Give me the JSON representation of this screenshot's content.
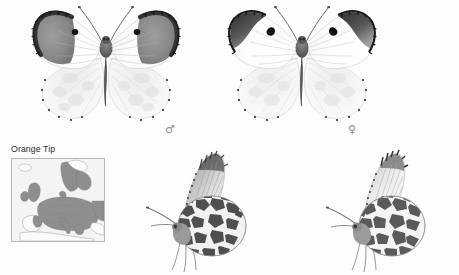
{
  "plate": {
    "kind": "field-guide-species-plate",
    "species_label": "Orange Tip",
    "background_color": "#fdfdfd",
    "width": 459,
    "height": 275
  },
  "map": {
    "title": "Orange Tip",
    "region": "Europe",
    "border_color": "#b6b6b6",
    "sea_color": "#f4f4f4",
    "land_unoccupied_color": "#fbfbfb",
    "range_fill_color": "#8e8e8e",
    "coast_line_color": "#9a9a9a"
  },
  "symbols": {
    "male": "♂",
    "female": "♀",
    "symbol_color": "#8d8d8d"
  },
  "specimens": [
    {
      "id": "male-upperside",
      "name": "male-upperside-specimen",
      "sex": "male",
      "view": "upperside",
      "sex_symbol": "♂",
      "wing_ground_color": "#fbfbfb",
      "apex_patch_color": "#8a8a8a",
      "apex_border_color": "#3a3a3a",
      "discal_spot_color": "#171717",
      "body_color": "#6e6e6e",
      "hindwing_mottle_color": "#dcdcdc",
      "vein_color": "#b9b9b9"
    },
    {
      "id": "female-upperside",
      "name": "female-upperside-specimen",
      "sex": "female",
      "view": "upperside",
      "sex_symbol": "♀",
      "wing_ground_color": "#fcfcfc",
      "apex_patch_color": "#4a4a4a",
      "apex_border_color": "#2a2a2a",
      "discal_spot_color": "#141414",
      "body_color": "#6a6a6a",
      "hindwing_mottle_color": "#dedede",
      "vein_color": "#bdbdbd"
    },
    {
      "id": "male-underside",
      "name": "male-underside-specimen",
      "sex": "male",
      "view": "underside",
      "forewing_apex_color": "#7e7e7e",
      "hindwing_mottle_color": "#4f4f4f",
      "hindwing_ground_color": "#f2f2f2",
      "body_color": "#8a8a8a"
    },
    {
      "id": "female-underside",
      "name": "female-underside-specimen",
      "sex": "female",
      "view": "underside",
      "forewing_apex_color": "#6f6f6f",
      "hindwing_mottle_color": "#5a5a5a",
      "hindwing_ground_color": "#f4f4f4",
      "body_color": "#8d8d8d"
    }
  ]
}
